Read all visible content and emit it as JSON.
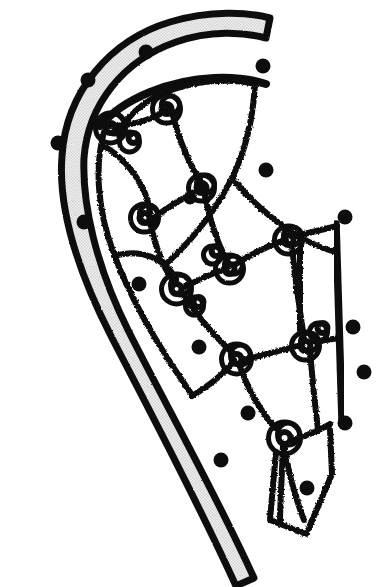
{
  "figure": {
    "title": "Lacrosse stick head with strung pocket",
    "background_color": "#ffffff",
    "ink_color": "#0d0d0d",
    "frame_fill_color": "#e7e7e7",
    "canvas": {
      "width": 378,
      "height": 587
    },
    "elements": {
      "frame_label": "stick head frame",
      "sidewall_label": "right sidewall rail",
      "mesh_label": "strung pocket mesh",
      "knot_label": "lacing knot",
      "peg_label": "stringing hole marker",
      "throat_label": "throat taper"
    },
    "counts": {
      "pegs": 16,
      "knots": 14,
      "mesh_cells": 12
    },
    "frame": {
      "outer_path": "M 62 156 C 66 92, 110 40, 170 22 C 210 10, 248 12, 270 18 L 266 38 C 244 32, 210 30, 176 42 C 124 60, 88 104, 84 158 C 82 204, 96 266, 128 330 C 162 398, 212 486, 254 578 L 236 586 C 196 498, 146 404, 112 338 C 76 268, 58 206, 62 156 Z",
      "inner_edge_path": "M 84 158 C 88 104, 124 60, 176 42 C 210 30, 244 32, 266 38",
      "outer_edge_path": "M 62 156 C 66 92, 110 40, 170 22 C 210 10, 248 12, 270 18"
    },
    "scoop": {
      "path": "M 100 126 C 124 98, 170 80, 214 78 C 238 77, 254 80, 266 84"
    },
    "right_rail": {
      "path": "M 336 224 L 342 420"
    },
    "pegs": [
      {
        "name": "peg-top-1",
        "cx": 146,
        "cy": 52,
        "r": 7.5
      },
      {
        "name": "peg-top-2",
        "cx": 263,
        "cy": 66,
        "r": 7.5
      },
      {
        "name": "peg-left-1",
        "cx": 88,
        "cy": 80,
        "r": 7.5
      },
      {
        "name": "peg-left-2",
        "cx": 58,
        "cy": 143,
        "r": 7.5
      },
      {
        "name": "peg-left-3",
        "cx": 84,
        "cy": 222,
        "r": 7.5
      },
      {
        "name": "peg-left-4",
        "cx": 139,
        "cy": 284,
        "r": 7.5
      },
      {
        "name": "peg-left-5",
        "cx": 199,
        "cy": 347,
        "r": 7.5
      },
      {
        "name": "peg-left-6",
        "cx": 248,
        "cy": 413,
        "r": 7.5
      },
      {
        "name": "peg-right-1",
        "cx": 266,
        "cy": 170,
        "r": 7.5
      },
      {
        "name": "peg-right-2",
        "cx": 345,
        "cy": 217,
        "r": 7.5
      },
      {
        "name": "peg-right-3",
        "cx": 353,
        "cy": 327,
        "r": 7.5
      },
      {
        "name": "peg-right-4",
        "cx": 364,
        "cy": 372,
        "r": 7.5
      },
      {
        "name": "peg-right-5",
        "cx": 345,
        "cy": 423,
        "r": 7.5
      },
      {
        "name": "peg-right-6",
        "cx": 307,
        "cy": 488,
        "r": 7.5
      },
      {
        "name": "peg-mid-1",
        "cx": 190,
        "cy": 198,
        "r": 6.5
      },
      {
        "name": "peg-mid-2",
        "cx": 221,
        "cy": 460,
        "r": 7.5
      }
    ],
    "knots": [
      {
        "name": "knot-a",
        "cx": 112,
        "cy": 126,
        "rings": [
          15,
          10,
          5
        ]
      },
      {
        "name": "knot-b",
        "cx": 168,
        "cy": 107,
        "rings": [
          14,
          9,
          5
        ]
      },
      {
        "name": "knot-c",
        "cx": 203,
        "cy": 186,
        "rings": [
          13,
          9,
          5
        ]
      },
      {
        "name": "knot-d",
        "cx": 146,
        "cy": 216,
        "rings": [
          14,
          9,
          5
        ]
      },
      {
        "name": "knot-e",
        "cx": 178,
        "cy": 287,
        "rings": [
          15,
          10,
          5
        ]
      },
      {
        "name": "knot-f",
        "cx": 231,
        "cy": 267,
        "rings": [
          14,
          9,
          5
        ]
      },
      {
        "name": "knot-g",
        "cx": 290,
        "cy": 238,
        "rings": [
          14,
          9,
          5
        ]
      },
      {
        "name": "knot-h",
        "cx": 238,
        "cy": 357,
        "rings": [
          15,
          10,
          5
        ]
      },
      {
        "name": "knot-i",
        "cx": 307,
        "cy": 344,
        "rings": [
          14,
          9,
          5
        ]
      },
      {
        "name": "knot-j",
        "cx": 286,
        "cy": 436,
        "rings": [
          16,
          11,
          6
        ]
      },
      {
        "name": "knot-k",
        "cx": 131,
        "cy": 140,
        "rings": [
          10,
          5
        ]
      },
      {
        "name": "knot-l",
        "cx": 214,
        "cy": 253,
        "rings": [
          9,
          5
        ]
      },
      {
        "name": "knot-m",
        "cx": 196,
        "cy": 304,
        "rings": [
          9,
          5
        ]
      },
      {
        "name": "knot-n",
        "cx": 320,
        "cy": 330,
        "rings": [
          9,
          5
        ]
      }
    ],
    "mesh_strands": [
      {
        "name": "strand-rim-inner",
        "d": "M 118 135 C 128 112, 152 94, 184 86 C 212 79, 238 80, 255 84"
      },
      {
        "name": "strand-rim-right",
        "d": "M 255 84 C 253 118, 246 150, 232 178 C 216 210, 192 240, 168 262"
      },
      {
        "name": "strand-rim-lower",
        "d": "M 232 178 C 250 200, 272 220, 298 236 C 312 244, 326 250, 337 252"
      },
      {
        "name": "strand-left-arc",
        "d": "M 104 132 C 94 168, 98 212, 114 254 C 130 298, 158 346, 190 392"
      },
      {
        "name": "strand-h1",
        "d": "M 110 126 C 134 126, 156 118, 170 108"
      },
      {
        "name": "strand-h2",
        "d": "M 104 146 C 124 158, 146 182, 150 212"
      },
      {
        "name": "strand-h3",
        "d": "M 172 112 C 178 138, 190 166, 202 184"
      },
      {
        "name": "strand-h4",
        "d": "M 150 220 C 170 206, 190 194, 202 188"
      },
      {
        "name": "strand-h5",
        "d": "M 204 192 C 210 220, 218 246, 228 262"
      },
      {
        "name": "strand-h6",
        "d": "M 150 222 C 156 250, 166 274, 176 284"
      },
      {
        "name": "strand-h7",
        "d": "M 182 288 C 198 280, 216 272, 228 268"
      },
      {
        "name": "strand-h8",
        "d": "M 236 264 C 252 254, 272 244, 286 240"
      },
      {
        "name": "strand-h9",
        "d": "M 292 244 C 294 272, 300 312, 304 338"
      },
      {
        "name": "strand-h10",
        "d": "M 182 292 C 196 316, 220 342, 234 354"
      },
      {
        "name": "strand-h11",
        "d": "M 242 360 C 262 356, 288 348, 302 345"
      },
      {
        "name": "strand-h12",
        "d": "M 239 364 C 248 390, 264 418, 280 432"
      },
      {
        "name": "strand-h13",
        "d": "M 292 440 C 306 436, 320 430, 330 424"
      },
      {
        "name": "strand-h14",
        "d": "M 310 348 C 312 380, 316 412, 318 430"
      },
      {
        "name": "strand-h15",
        "d": "M 114 256 C 140 248, 166 258, 176 280"
      },
      {
        "name": "strand-h16",
        "d": "M 192 396 C 212 384, 228 370, 234 360"
      },
      {
        "name": "strand-h17",
        "d": "M 284 444 C 288 470, 296 500, 304 520"
      },
      {
        "name": "strand-h18",
        "d": "M 283 446 C 282 474, 280 506, 280 522"
      },
      {
        "name": "strand-tail-left",
        "d": "M 276 452 L 270 520 L 306 534"
      },
      {
        "name": "strand-tail-right",
        "d": "M 330 430 L 332 474 L 308 530"
      },
      {
        "name": "strand-rail-left",
        "d": "M 300 240 L 300 330"
      },
      {
        "name": "strand-rail-top",
        "d": "M 296 236 L 337 226"
      },
      {
        "name": "strand-rail-mid",
        "d": "M 312 342 L 340 338"
      }
    ]
  }
}
